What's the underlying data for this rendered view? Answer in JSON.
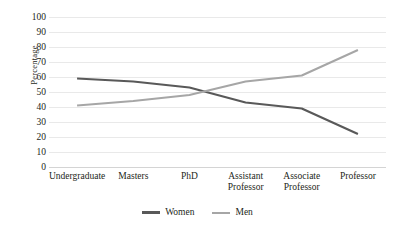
{
  "chart_data": {
    "type": "line",
    "title": "",
    "xlabel": "",
    "ylabel": "Percentage",
    "ylim": [
      0,
      100
    ],
    "yticks": [
      0,
      10,
      20,
      30,
      40,
      50,
      60,
      70,
      80,
      90,
      100
    ],
    "ytick_labels": [
      "0",
      "10",
      "20",
      "30",
      "40",
      "50",
      "60",
      "70",
      "80",
      "90",
      "100"
    ],
    "grid": true,
    "legend_position": "bottom",
    "categories": [
      "Undergraduate",
      "Masters",
      "PhD",
      "Assistant Professor",
      "Associate Professor",
      "Professor"
    ],
    "category_lines": [
      [
        "Undergraduate",
        ""
      ],
      [
        "Masters",
        ""
      ],
      [
        "PhD",
        ""
      ],
      [
        "Assistant",
        "Professor"
      ],
      [
        "Associate",
        "Professor"
      ],
      [
        "Professor",
        ""
      ]
    ],
    "series": [
      {
        "name": "Women",
        "color": "#595959",
        "width": 2.2,
        "values": [
          59,
          57,
          53,
          43,
          39,
          22
        ]
      },
      {
        "name": "Men",
        "color": "#a6a6a6",
        "width": 2.0,
        "values": [
          41,
          44,
          48,
          57,
          61,
          78
        ]
      }
    ]
  },
  "legend": {
    "items": [
      {
        "label": "Women",
        "color": "#595959"
      },
      {
        "label": "Men",
        "color": "#a6a6a6"
      }
    ]
  },
  "colors": {
    "women": "#595959",
    "men": "#a6a6a6",
    "grid": "#e9e9e9",
    "text": "#231f20",
    "background": "#ffffff"
  }
}
